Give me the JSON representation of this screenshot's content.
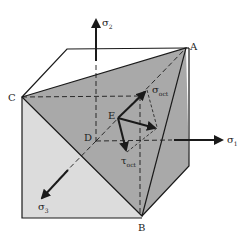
{
  "figure": {
    "type": "octahedral-plane-diagram",
    "colors": {
      "background": "#ffffff",
      "octahedral_plane": "#a9a9a9",
      "front_face": "#dcdcdc",
      "line": "#1a1a1a"
    },
    "vertices": {
      "A": "A",
      "B": "B",
      "C": "C",
      "D": "D",
      "E": "E"
    },
    "axes": {
      "sigma1": {
        "symbol": "σ",
        "subscript": "1"
      },
      "sigma2": {
        "symbol": "σ",
        "subscript": "2"
      },
      "sigma3": {
        "symbol": "σ",
        "subscript": "3"
      }
    },
    "vectors": {
      "sigma_oct": {
        "symbol": "σ",
        "subscript": "oct"
      },
      "tau_oct": {
        "symbol": "τ",
        "subscript": "oct"
      }
    }
  }
}
